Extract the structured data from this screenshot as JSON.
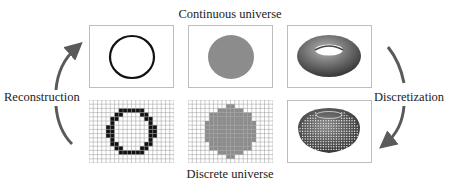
{
  "titles": {
    "top": "Continuous universe",
    "bottom": "Discrete universe"
  },
  "processes": {
    "left": "Reconstruction",
    "right": "Discretization"
  },
  "panels": [
    {
      "row": "continuous",
      "content": "circle outline"
    },
    {
      "row": "continuous",
      "content": "filled disk"
    },
    {
      "row": "continuous",
      "content": "torus"
    },
    {
      "row": "discrete",
      "content": "pixelated circle outline on grid"
    },
    {
      "row": "discrete",
      "content": "pixelated filled disk on grid"
    },
    {
      "row": "discrete",
      "content": "voxelized torus"
    }
  ],
  "colors": {
    "arrow": "#5a5a5a",
    "disk": "#8c8c8c",
    "outline": "#111111",
    "grid": "#9a9a9a",
    "torus": "#6e6e6e"
  },
  "icons": {
    "left_arrow": "curved-arrow-up",
    "right_arrow": "curved-arrow-down"
  }
}
